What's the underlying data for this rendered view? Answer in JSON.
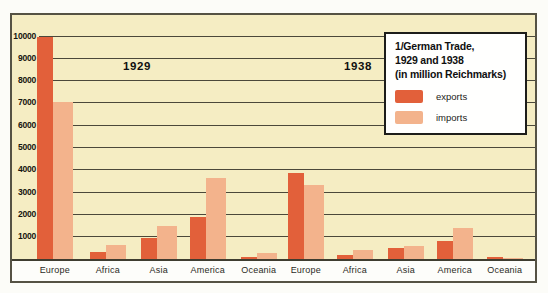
{
  "figure": {
    "title_lines": [
      "1/German Trade,",
      "1929 and 1938",
      "(in million Reichmarks)"
    ],
    "period_labels": [
      "1929",
      "1938"
    ]
  },
  "legend": {
    "items": [
      {
        "label": "exports",
        "color": "#e2603a"
      },
      {
        "label": "imports",
        "color": "#f3b38c"
      }
    ]
  },
  "colors": {
    "plot_background": "#f5edc3",
    "frame_border": "#555244",
    "gridline": "#4b483a",
    "exports_bar": "#e2603a",
    "imports_bar": "#f3b38c",
    "label_strip": "#fdfdfa",
    "text": "#15150f"
  },
  "chart_data": {
    "type": "bar",
    "title": "1/German Trade, 1929 and 1938 (in million Reichmarks)",
    "unit": "million Reichmarks",
    "ylim": [
      0,
      10000
    ],
    "yticks": [
      1000,
      2000,
      3000,
      4000,
      5000,
      6000,
      7000,
      8000,
      9000,
      10000
    ],
    "grid": true,
    "legend_position": "top-right",
    "categories": [
      "Europe",
      "Africa",
      "Asia",
      "America",
      "Oceania"
    ],
    "groups": [
      {
        "period": "1929",
        "series": [
          {
            "name": "exports",
            "values": [
              9950,
              300,
              950,
              1900,
              100
            ]
          },
          {
            "name": "imports",
            "values": [
              7050,
              650,
              1500,
              3650,
              250
            ]
          }
        ]
      },
      {
        "period": "1938",
        "series": [
          {
            "name": "exports",
            "values": [
              3850,
              200,
              500,
              800,
              100
            ]
          },
          {
            "name": "imports",
            "values": [
              3300,
              400,
              600,
              1400,
              50
            ]
          }
        ]
      }
    ]
  }
}
